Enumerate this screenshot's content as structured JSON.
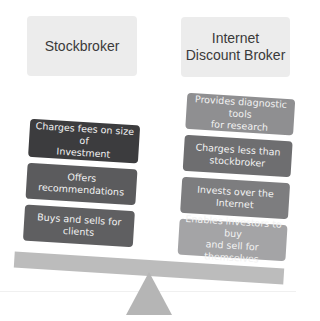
{
  "diagram": {
    "type": "balance-scale-comparison",
    "left": {
      "title": "Stockbroker",
      "blocks": [
        {
          "label": "Charges fees on size of\nInvestment",
          "color": "#3c3c3e"
        },
        {
          "label": "Offers recommendations",
          "color": "#5b5b5d"
        },
        {
          "label": "Buys and sells for clients",
          "color": "#5f5f61"
        }
      ]
    },
    "right": {
      "title": "Internet\nDiscount Broker",
      "blocks": [
        {
          "label": "Provides diagnostic tools\nfor research",
          "color": "#8f8f91"
        },
        {
          "label": "Charges less than\nstockbroker",
          "color": "#6e6e70"
        },
        {
          "label": "Invests over the Internet",
          "color": "#7d7d7f"
        },
        {
          "label": "Enables investors to buy\nand sell for themselves",
          "color": "#a4a4a6"
        }
      ]
    },
    "colors": {
      "header_bg": "#ececec",
      "beam": "#bcbcbc",
      "fulcrum": "#b5b5b5"
    }
  }
}
